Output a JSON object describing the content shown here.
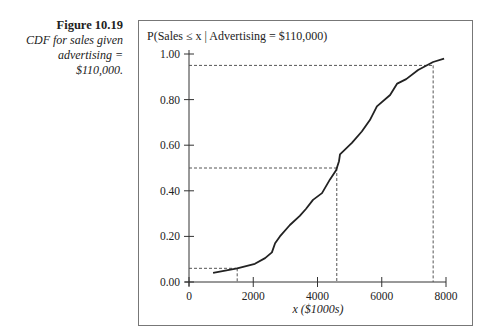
{
  "figure": {
    "number": "Figure 10.19",
    "caption_lines": [
      "CDF for sales given",
      "advertising =",
      "$110,000."
    ]
  },
  "chart_data": {
    "type": "line",
    "title": "P(Sales ≤ x | Advertising = $110,000)",
    "xlabel": "x ($1000s)",
    "ylabel": "P(Sales ≤ x | Advertising = $110,000)",
    "xlim": [
      0,
      8000
    ],
    "ylim": [
      0,
      1.0
    ],
    "x_ticks": [
      0,
      2000,
      4000,
      6000,
      8000
    ],
    "x_tick_labels": [
      "0",
      "2000",
      "4000",
      "6000",
      "8000"
    ],
    "y_ticks": [
      0,
      0.2,
      0.4,
      0.6,
      0.8,
      1.0
    ],
    "y_tick_labels": [
      "0.00",
      "0.20",
      "0.40",
      "0.60",
      "0.80",
      "1.00"
    ],
    "grid": false,
    "legend": null,
    "series": [
      {
        "name": "CDF",
        "x": [
          750,
          1500,
          2050,
          2370,
          2580,
          2680,
          2830,
          3140,
          3450,
          3640,
          3860,
          4140,
          4390,
          4580,
          4670,
          4700,
          5070,
          5380,
          5630,
          5850,
          6260,
          6480,
          6760,
          7130,
          7600,
          7940
        ],
        "y": [
          0.04,
          0.06,
          0.08,
          0.105,
          0.13,
          0.17,
          0.2,
          0.25,
          0.29,
          0.32,
          0.36,
          0.39,
          0.45,
          0.49,
          0.53,
          0.56,
          0.61,
          0.66,
          0.71,
          0.77,
          0.82,
          0.87,
          0.89,
          0.93,
          0.965,
          0.98
        ]
      }
    ],
    "annotations": [
      {
        "type": "dashed-reference",
        "x": 1500,
        "y": 0.06
      },
      {
        "type": "dashed-reference",
        "x": 4600,
        "y": 0.5
      },
      {
        "type": "dashed-reference",
        "x": 7600,
        "y": 0.95
      }
    ]
  }
}
